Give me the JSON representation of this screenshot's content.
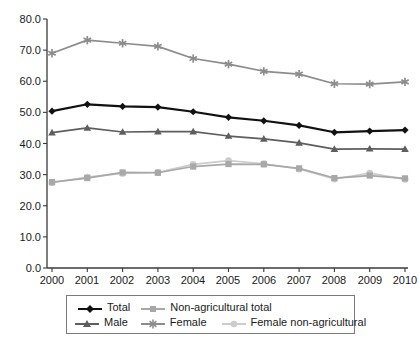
{
  "chart_data": {
    "type": "line",
    "title": "",
    "subtitle": "",
    "xlabel": "",
    "ylabel": "",
    "categories": [
      "2000",
      "2001",
      "2002",
      "2003",
      "2004",
      "2005",
      "2006",
      "2007",
      "2008",
      "2009",
      "2010"
    ],
    "x": [
      2000,
      2001,
      2002,
      2003,
      2004,
      2005,
      2006,
      2007,
      2008,
      2009,
      2010
    ],
    "xlim": [
      2000,
      2010
    ],
    "ylim": [
      0.0,
      80.0
    ],
    "yticks": [
      "0.0",
      "10.0",
      "20.0",
      "30.0",
      "40.0",
      "50.0",
      "60.0",
      "70.0",
      "80.0"
    ],
    "ytick_values": [
      0.0,
      10.0,
      20.0,
      30.0,
      40.0,
      50.0,
      60.0,
      70.0,
      80.0
    ],
    "grid": false,
    "legend_position": "bottom",
    "series": [
      {
        "name": "Total",
        "marker": "diamond",
        "color": "#111111",
        "values": [
          50.4,
          52.6,
          51.9,
          51.7,
          50.2,
          48.4,
          47.3,
          45.8,
          43.6,
          44.0,
          44.3
        ]
      },
      {
        "name": "Non-agricultural total",
        "marker": "square",
        "color": "#a8a8a8",
        "values": [
          27.6,
          28.9,
          30.7,
          30.6,
          32.6,
          33.4,
          33.3,
          32.0,
          28.9,
          29.7,
          28.8
        ]
      },
      {
        "name": "Male",
        "marker": "triangle",
        "color": "#5e5e5e",
        "values": [
          43.5,
          45.0,
          43.7,
          43.8,
          43.8,
          42.4,
          41.5,
          40.2,
          38.2,
          38.3,
          38.2
        ]
      },
      {
        "name": "Female",
        "marker": "star",
        "color": "#8c8c8c",
        "values": [
          69.0,
          73.2,
          72.2,
          71.2,
          67.3,
          65.5,
          63.2,
          62.3,
          59.2,
          59.1,
          59.8
        ]
      },
      {
        "name": "Female non-agricultural",
        "marker": "circle",
        "color": "#cccccc",
        "values": [
          27.4,
          29.2,
          30.4,
          30.7,
          33.3,
          34.5,
          33.5,
          31.8,
          28.6,
          30.5,
          28.5
        ]
      }
    ]
  },
  "legend": {
    "items": [
      {
        "label": "Total",
        "key": "legend-key-total"
      },
      {
        "label": "Non-agricultural total",
        "key": "legend-key-nonagri-total"
      },
      {
        "label": "Male",
        "key": "legend-key-male"
      },
      {
        "label": "Female",
        "key": "legend-key-female"
      },
      {
        "label": "Female non-agricultural",
        "key": "legend-key-female-nonagri"
      }
    ]
  },
  "axes": {
    "y_tick_0": "0.0",
    "y_tick_1": "10.0",
    "y_tick_2": "20.0",
    "y_tick_3": "30.0",
    "y_tick_4": "40.0",
    "y_tick_5": "50.0",
    "y_tick_6": "60.0",
    "y_tick_7": "70.0",
    "y_tick_8": "80.0",
    "x_tick_0": "2000",
    "x_tick_1": "2001",
    "x_tick_2": "2002",
    "x_tick_3": "2003",
    "x_tick_4": "2004",
    "x_tick_5": "2005",
    "x_tick_6": "2006",
    "x_tick_7": "2007",
    "x_tick_8": "2008",
    "x_tick_9": "2009",
    "x_tick_10": "2010"
  }
}
